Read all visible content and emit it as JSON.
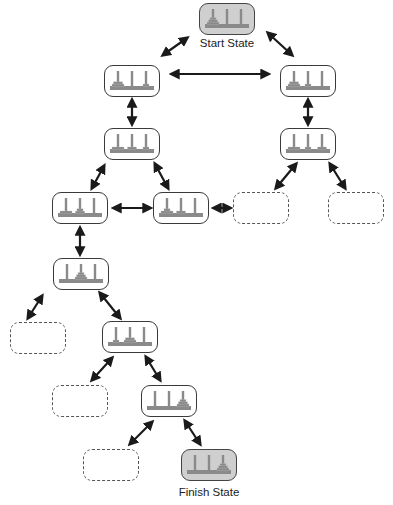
{
  "diagram": {
    "labels": {
      "start": "Start State",
      "finish": "Finish State"
    },
    "colors": {
      "stroke": "#3a3a3a",
      "terminal_fill": "#cfcfcf",
      "disk": "#8a8a8a",
      "arrow": "#1a1a1a"
    },
    "states": [
      {
        "id": "start",
        "x": 199,
        "y": 3,
        "kind": "terminal",
        "disks": [
          [
            3,
            2,
            1
          ],
          [],
          []
        ]
      },
      {
        "id": "s1",
        "x": 104,
        "y": 65,
        "kind": "normal",
        "disks": [
          [
            3,
            2
          ],
          [],
          [
            1
          ]
        ]
      },
      {
        "id": "s2",
        "x": 280,
        "y": 65,
        "kind": "normal",
        "disks": [
          [
            3,
            2
          ],
          [
            1
          ],
          []
        ]
      },
      {
        "id": "s3",
        "x": 104,
        "y": 128,
        "kind": "normal",
        "disks": [
          [
            3
          ],
          [
            2
          ],
          [
            1
          ]
        ]
      },
      {
        "id": "s4",
        "x": 280,
        "y": 128,
        "kind": "normal",
        "disks": [
          [
            3
          ],
          [
            1
          ],
          [
            2
          ]
        ]
      },
      {
        "id": "s5",
        "x": 52,
        "y": 192,
        "kind": "normal",
        "disks": [
          [
            3
          ],
          [
            2,
            1
          ],
          []
        ]
      },
      {
        "id": "s6",
        "x": 153,
        "y": 192,
        "kind": "normal",
        "disks": [
          [
            3,
            1
          ],
          [
            2
          ],
          []
        ]
      },
      {
        "id": "e1",
        "x": 233,
        "y": 192,
        "kind": "empty"
      },
      {
        "id": "e2",
        "x": 328,
        "y": 192,
        "kind": "empty"
      },
      {
        "id": "s7",
        "x": 53,
        "y": 258,
        "kind": "normal",
        "disks": [
          [],
          [
            3,
            2,
            1
          ],
          []
        ]
      },
      {
        "id": "e3",
        "x": 10,
        "y": 322,
        "kind": "empty"
      },
      {
        "id": "s8",
        "x": 102,
        "y": 321,
        "kind": "normal",
        "disks": [
          [
            1
          ],
          [
            3,
            2
          ],
          []
        ]
      },
      {
        "id": "e4",
        "x": 52,
        "y": 385,
        "kind": "empty"
      },
      {
        "id": "s9",
        "x": 141,
        "y": 385,
        "kind": "normal",
        "disks": [
          [],
          [],
          [
            3,
            2,
            1
          ]
        ]
      },
      {
        "id": "e5",
        "x": 83,
        "y": 449,
        "kind": "empty"
      },
      {
        "id": "finish",
        "x": 181,
        "y": 449,
        "kind": "terminal",
        "disks": [
          [],
          [],
          [
            3,
            2,
            1
          ]
        ]
      }
    ],
    "edges": [
      [
        163,
        55,
        187,
        38
      ],
      [
        268,
        33,
        292,
        55
      ],
      [
        172,
        74,
        268,
        74
      ],
      [
        132,
        100,
        132,
        124
      ],
      [
        308,
        100,
        308,
        124
      ],
      [
        104,
        166,
        92,
        188
      ],
      [
        155,
        164,
        168,
        188
      ],
      [
        296,
        164,
        276,
        188
      ],
      [
        330,
        164,
        345,
        188
      ],
      [
        114,
        208,
        150,
        208
      ],
      [
        214,
        208,
        230,
        208
      ],
      [
        80,
        228,
        80,
        254
      ],
      [
        42,
        296,
        28,
        318
      ],
      [
        100,
        293,
        120,
        318
      ],
      [
        112,
        358,
        92,
        380
      ],
      [
        146,
        357,
        160,
        380
      ],
      [
        152,
        422,
        130,
        444
      ],
      [
        185,
        421,
        200,
        444
      ]
    ]
  }
}
